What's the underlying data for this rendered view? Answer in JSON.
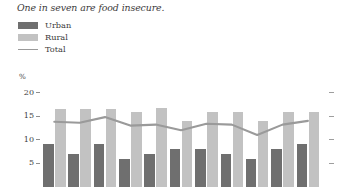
{
  "title": "One in seven are food insecure.",
  "legend": {
    "position": "top-left",
    "items": [
      {
        "label": "Urban",
        "type": "bar",
        "color": "#6f6f6f",
        "icon": "square-swatch-icon"
      },
      {
        "label": "Rural",
        "type": "bar",
        "color": "#c2c2c2",
        "icon": "square-swatch-icon"
      },
      {
        "label": "Total",
        "type": "line",
        "color": "#9a9a9a",
        "icon": "line-swatch-icon"
      }
    ]
  },
  "axis": {
    "y_unit_label": "%",
    "y_ticks": [
      "20",
      "15",
      "10",
      "5"
    ],
    "y_tick_values": [
      20,
      15,
      10,
      5
    ],
    "ylim": [
      0,
      20
    ],
    "grid": false,
    "right_ticks": true
  },
  "chart_data": {
    "type": "bar",
    "title": "One in seven are food insecure.",
    "xlabel": "",
    "ylabel": "%",
    "ylim": [
      0,
      20
    ],
    "grid": false,
    "legend_position": "top-left",
    "categories": [
      "1",
      "2",
      "3",
      "4",
      "5",
      "6",
      "7",
      "8",
      "9",
      "10",
      "11"
    ],
    "series": [
      {
        "name": "Urban",
        "type": "bar",
        "color": "#6f6f6f",
        "values": [
          9,
          7,
          9,
          6,
          7,
          8,
          8,
          7,
          6,
          8,
          9
        ]
      },
      {
        "name": "Rural",
        "type": "bar",
        "color": "#c2c2c2",
        "values": [
          16.5,
          16.5,
          16.5,
          15.8,
          16.7,
          14.0,
          15.8,
          15.8,
          14.0,
          15.9,
          15.9
        ]
      },
      {
        "name": "Total",
        "type": "line",
        "color": "#9a9a9a",
        "values": [
          13.8,
          13.6,
          14.8,
          13.0,
          13.2,
          12.0,
          13.4,
          13.2,
          11.0,
          13.2,
          14.0
        ]
      }
    ]
  }
}
